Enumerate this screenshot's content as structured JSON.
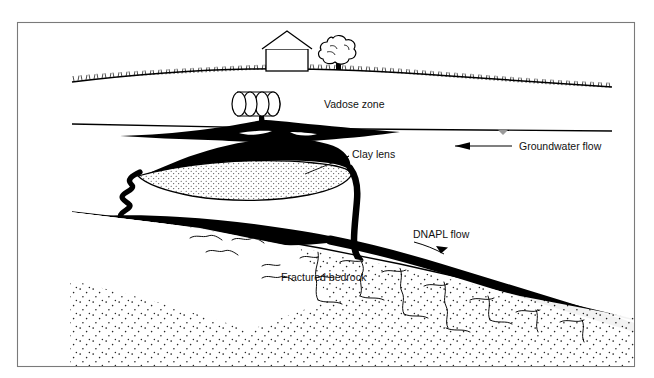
{
  "page": {
    "cutoff_text_top": "",
    "background_color": "#ffffff",
    "ink_color": "#000000",
    "frame_color": "#7a7a7a"
  },
  "figure": {
    "frame": {
      "x": 17,
      "y": 22,
      "width": 618,
      "height": 345
    }
  },
  "labels": {
    "vadose_zone": "Vadose zone",
    "groundwater_flow": "Groundwater flow",
    "clay_lens": "Clay lens",
    "dnapl_flow": "DNAPL flow",
    "fractured_bedrock": "Fractured bedrock"
  },
  "features": {
    "house": "house",
    "tree": "tree",
    "drums": "buried-waste-drums",
    "drum_count": 4,
    "ground_surface": "ground-surface-with-grass",
    "water_table": "water-table-line",
    "water_table_symbol": "water-table-triangle",
    "dnapl_plume": "dnapl-plume",
    "dnapl_pool_on_clay": "dnapl-pool-on-clay-lens",
    "clay_lens_shape": "clay-lens-stippled",
    "bedrock_surface": "bedrock-surface-line",
    "fractures": "bedrock-fracture-lines",
    "bedrock_stipple": "bedrock-stipple-texture",
    "groundwater_arrow_direction": "left",
    "dnapl_arrow_direction": "down-right"
  }
}
